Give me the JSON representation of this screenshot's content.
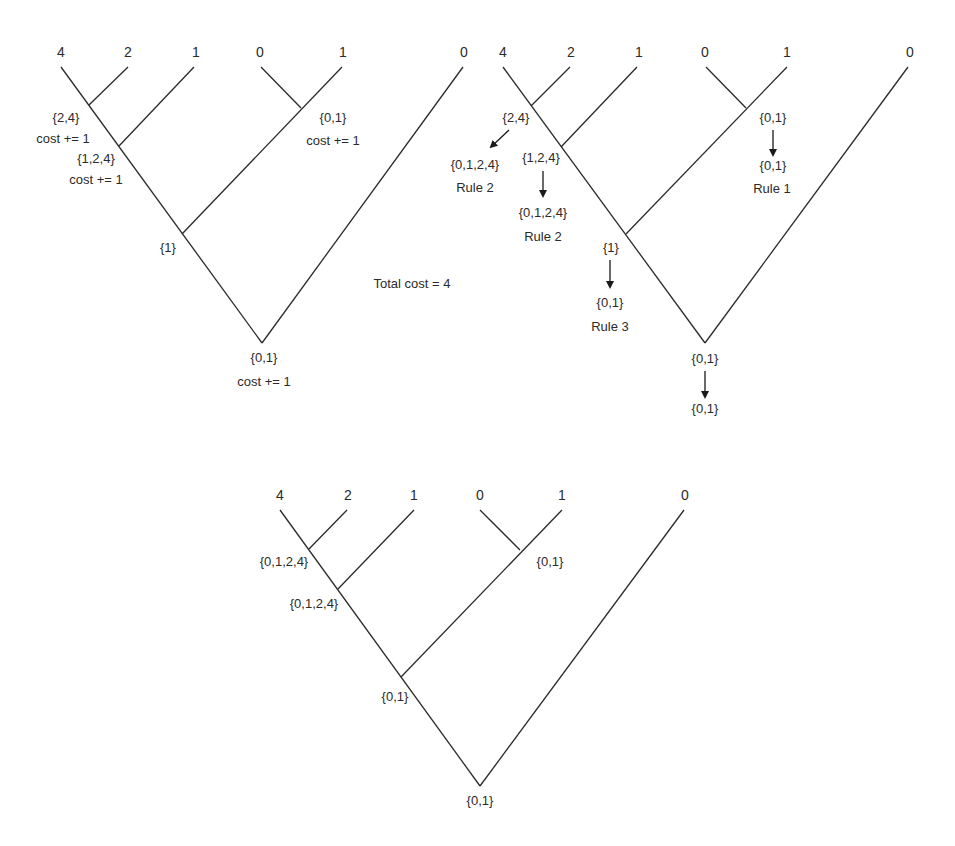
{
  "total_cost_label": "Total cost = 4",
  "leaves": [
    "4",
    "2",
    "1",
    "0",
    "1",
    "0"
  ],
  "trees": [
    {
      "id": "bottom-up",
      "leaves": [
        {
          "label": "4",
          "x": 61,
          "y": 67
        },
        {
          "label": "2",
          "x": 128,
          "y": 67
        },
        {
          "label": "1",
          "x": 194,
          "y": 67
        },
        {
          "label": "0",
          "x": 261,
          "y": 67
        },
        {
          "label": "1",
          "x": 342,
          "y": 67
        },
        {
          "label": "0",
          "x": 463,
          "y": 67
        }
      ],
      "internal_nodes": [
        {
          "id": "n24",
          "x": 89,
          "y": 105,
          "set": "{2,4}",
          "note": "cost += 1"
        },
        {
          "id": "n124",
          "x": 119,
          "y": 146,
          "set": "{1,2,4}",
          "note": "cost += 1"
        },
        {
          "id": "n01",
          "x": 301,
          "y": 108,
          "set": "{0,1}",
          "note": "cost += 1"
        },
        {
          "id": "n1",
          "x": 182,
          "y": 234,
          "set": "{1}",
          "note": ""
        },
        {
          "id": "root",
          "x": 262,
          "y": 343,
          "set": "{0,1}",
          "note": "cost += 1"
        }
      ]
    },
    {
      "id": "top-down",
      "leaves": [
        {
          "label": "4",
          "x": 503,
          "y": 67
        },
        {
          "label": "2",
          "x": 570,
          "y": 67
        },
        {
          "label": "1",
          "x": 637,
          "y": 67
        },
        {
          "label": "0",
          "x": 706,
          "y": 67
        },
        {
          "label": "1",
          "x": 787,
          "y": 67
        },
        {
          "label": "0",
          "x": 908,
          "y": 67
        }
      ],
      "internal_nodes": [
        {
          "id": "n24",
          "x": 531,
          "y": 106,
          "set": "{2,4}",
          "result": "{0,1,2,4}",
          "rule": "Rule 2"
        },
        {
          "id": "n124",
          "x": 561,
          "y": 147,
          "set": "{1,2,4}",
          "result": "{0,1,2,4}",
          "rule": "Rule 2"
        },
        {
          "id": "n01",
          "x": 746,
          "y": 108,
          "set": "{0,1}",
          "result": "{0,1}",
          "rule": "Rule 1"
        },
        {
          "id": "n1",
          "x": 626,
          "y": 234,
          "set": "{1}",
          "result": "{0,1}",
          "rule": "Rule 3"
        },
        {
          "id": "root",
          "x": 705,
          "y": 343,
          "set": "{0,1}",
          "result": "{0,1}",
          "rule": ""
        }
      ]
    },
    {
      "id": "final",
      "leaves": [
        {
          "label": "4",
          "x": 280,
          "y": 510
        },
        {
          "label": "2",
          "x": 347,
          "y": 510
        },
        {
          "label": "1",
          "x": 414,
          "y": 510
        },
        {
          "label": "0",
          "x": 480,
          "y": 510
        },
        {
          "label": "1",
          "x": 562,
          "y": 510
        },
        {
          "label": "0",
          "x": 684,
          "y": 510
        }
      ],
      "internal_nodes": [
        {
          "id": "n24",
          "x": 309,
          "y": 549,
          "set": "{0,1,2,4}"
        },
        {
          "id": "n124",
          "x": 338,
          "y": 589,
          "set": "{0,1,2,4}"
        },
        {
          "id": "n01",
          "x": 520,
          "y": 550,
          "set": "{0,1}"
        },
        {
          "id": "n1",
          "x": 401,
          "y": 677,
          "set": "{0,1}"
        },
        {
          "id": "root",
          "x": 480,
          "y": 786,
          "set": "{0,1}"
        }
      ]
    }
  ],
  "colors": {
    "line": "#2a2a2a",
    "text": "#2b2b2b",
    "background": "#ffffff"
  }
}
